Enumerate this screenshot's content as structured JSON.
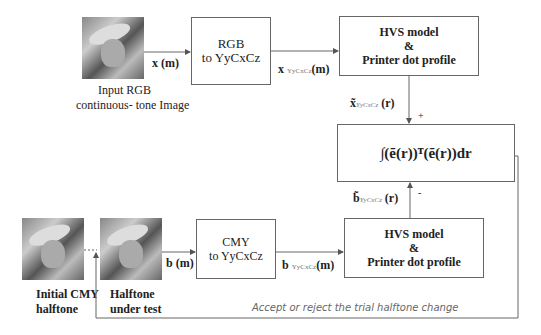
{
  "images": {
    "input": {
      "caption_line1": "Input RGB",
      "caption_line2": "continuous- tone Image"
    },
    "initial": {
      "caption_line1": "Initial CMY",
      "caption_line2": "halftone"
    },
    "test": {
      "caption_line1": "Halftone",
      "caption_line2": "under test"
    }
  },
  "boxes": {
    "rgb": {
      "line1": "RGB",
      "line2": "to YyCxCz"
    },
    "hvs_top": {
      "line1": "HVS model",
      "line2": "&",
      "line3": "Printer dot profile"
    },
    "error": {
      "formula": "∫(ẽ(r))ᵀ(ẽ(r))dr"
    },
    "cmy": {
      "line1": "CMY",
      "line2": "to YyCxCz"
    },
    "hvs_bottom": {
      "line1": "HVS model",
      "line2": "&",
      "line3": "Printer dot profile"
    }
  },
  "labels": {
    "x_m": "x (m)",
    "x_ycc": "x",
    "x_ycc_sub": "YyCxCz",
    "x_ycc_m": "(m)",
    "x_tilde": "x̃",
    "x_tilde_sub": "YyCxCz",
    "r": "(r)",
    "plus": "+",
    "minus": "-",
    "b_tilde": "b̃",
    "b_tilde_sub": "YyCxCz",
    "b_m": "b (m)",
    "b_ycc": "b",
    "b_ycc_sub": "YyCxCz",
    "b_ycc_m": "(m)",
    "feedback": "Accept or reject the trial halftone change"
  }
}
